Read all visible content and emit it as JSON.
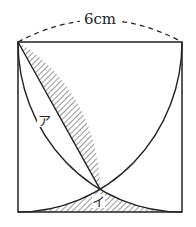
{
  "diagram": {
    "dimension_label": "6cm",
    "region_labels": [
      "ア",
      "イ"
    ],
    "colors": {
      "stroke": "#222222",
      "background": "#ffffff"
    }
  }
}
